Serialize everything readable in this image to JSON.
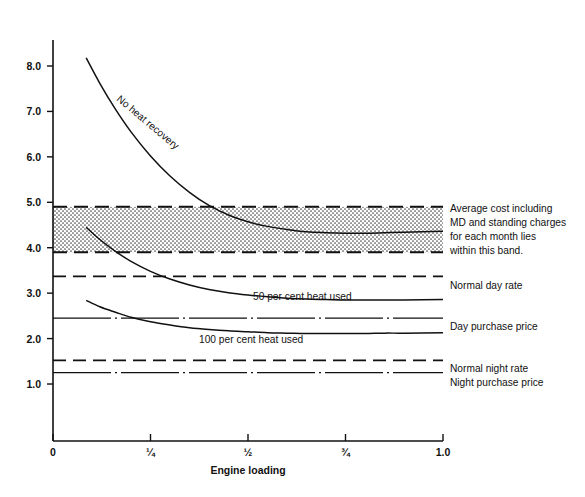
{
  "chart_data": {
    "type": "line",
    "title": "",
    "xlabel": "Engine loading",
    "ylabel": "",
    "xlim": [
      0,
      1.0
    ],
    "ylim": [
      0.55,
      8.55
    ],
    "grid": false,
    "legend_position": "right-inline-annotations",
    "x_ticks": [
      {
        "value": 0,
        "label": "0"
      },
      {
        "value": 0.25,
        "label": "¼"
      },
      {
        "value": 0.5,
        "label": "½"
      },
      {
        "value": 0.75,
        "label": "¾"
      },
      {
        "value": 1.0,
        "label": "1.0"
      }
    ],
    "y_ticks": [
      {
        "value": 1.0,
        "label": "1.0"
      },
      {
        "value": 2.0,
        "label": "2.0"
      },
      {
        "value": 3.0,
        "label": "3.0"
      },
      {
        "value": 4.0,
        "label": "4.0"
      },
      {
        "value": 5.0,
        "label": "5.0"
      },
      {
        "value": 6.0,
        "label": "6.0"
      },
      {
        "value": 7.0,
        "label": "7.0"
      },
      {
        "value": 8.0,
        "label": "8.0"
      }
    ],
    "series": [
      {
        "name": "No heat recovery",
        "style": "solid",
        "label_inline": "No heat recovery",
        "points": [
          [
            0.085,
            8.18
          ],
          [
            0.12,
            7.62
          ],
          [
            0.16,
            7.05
          ],
          [
            0.2,
            6.55
          ],
          [
            0.25,
            6.02
          ],
          [
            0.3,
            5.58
          ],
          [
            0.35,
            5.22
          ],
          [
            0.4,
            4.93
          ],
          [
            0.45,
            4.72
          ],
          [
            0.5,
            4.57
          ],
          [
            0.55,
            4.47
          ],
          [
            0.6,
            4.4
          ],
          [
            0.65,
            4.35
          ],
          [
            0.7,
            4.33
          ],
          [
            0.75,
            4.32
          ],
          [
            0.8,
            4.32
          ],
          [
            0.85,
            4.33
          ],
          [
            0.9,
            4.34
          ],
          [
            1.0,
            4.36
          ]
        ]
      },
      {
        "name": "50 per cent heat used",
        "style": "solid",
        "label_inline": "50 per cent heat used",
        "points": [
          [
            0.085,
            4.45
          ],
          [
            0.12,
            4.18
          ],
          [
            0.16,
            3.92
          ],
          [
            0.2,
            3.7
          ],
          [
            0.25,
            3.48
          ],
          [
            0.3,
            3.31
          ],
          [
            0.35,
            3.18
          ],
          [
            0.4,
            3.08
          ],
          [
            0.45,
            3.01
          ],
          [
            0.5,
            2.96
          ],
          [
            0.55,
            2.92
          ],
          [
            0.6,
            2.89
          ],
          [
            0.65,
            2.87
          ],
          [
            0.7,
            2.86
          ],
          [
            0.75,
            2.85
          ],
          [
            0.8,
            2.85
          ],
          [
            0.85,
            2.85
          ],
          [
            0.9,
            2.85
          ],
          [
            1.0,
            2.86
          ]
        ]
      },
      {
        "name": "100 per cent heat used",
        "style": "solid",
        "label_inline": "100 per cent heat used",
        "points": [
          [
            0.085,
            2.84
          ],
          [
            0.12,
            2.7
          ],
          [
            0.16,
            2.58
          ],
          [
            0.2,
            2.47
          ],
          [
            0.25,
            2.37
          ],
          [
            0.3,
            2.3
          ],
          [
            0.35,
            2.24
          ],
          [
            0.4,
            2.2
          ],
          [
            0.45,
            2.17
          ],
          [
            0.5,
            2.15
          ],
          [
            0.55,
            2.13
          ],
          [
            0.6,
            2.12
          ],
          [
            0.65,
            2.11
          ],
          [
            0.7,
            2.11
          ],
          [
            0.75,
            2.11
          ],
          [
            0.8,
            2.11
          ],
          [
            0.85,
            2.12
          ],
          [
            0.9,
            2.12
          ],
          [
            1.0,
            2.13
          ]
        ]
      }
    ],
    "reference_lines": [
      {
        "name": "normal-day-rate",
        "label": "Normal day rate",
        "value": 3.37,
        "style": "dashed"
      },
      {
        "name": "day-purchase-price",
        "label": "Day purchase price",
        "value": 2.45,
        "style": "dash-dot"
      },
      {
        "name": "normal-night-rate",
        "label": "Normal night rate",
        "value": 1.52,
        "style": "dashed"
      },
      {
        "name": "night-purchase-price",
        "label": "Night purchase price",
        "value": 1.25,
        "style": "dash-dot"
      }
    ],
    "band": {
      "name": "average-cost-band",
      "top": 4.9,
      "bottom": 3.9,
      "fill": "#d9d9d9",
      "annotation_lines": [
        "Average cost including",
        "MD and standing charges",
        "for each month lies",
        "within this band."
      ]
    }
  },
  "colors": {
    "ink": "#111111",
    "band_fill": "#d9d9d9",
    "background": "#ffffff"
  }
}
